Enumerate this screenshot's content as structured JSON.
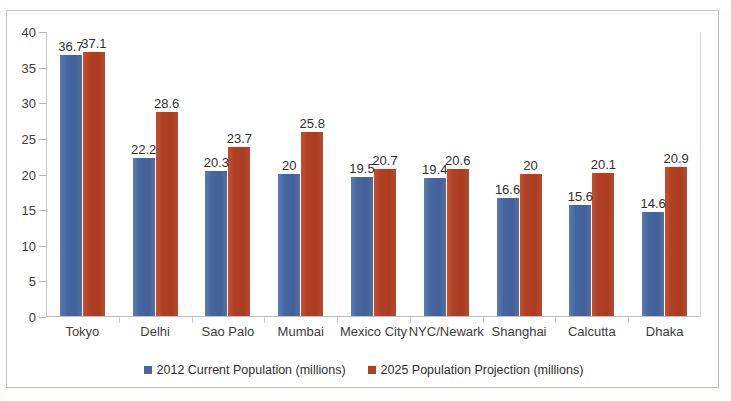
{
  "chart_data": {
    "type": "bar",
    "title": "",
    "xlabel": "",
    "ylabel": "",
    "ylim": [
      0,
      40
    ],
    "yticks": [
      0,
      5,
      10,
      15,
      20,
      25,
      30,
      35,
      40
    ],
    "grid": false,
    "legend_position": "bottom",
    "categories": [
      "Tokyo",
      "Delhi",
      "Sao Palo",
      "Mumbai",
      "Mexico City",
      "NYC/Newark",
      "Shanghai",
      "Calcutta",
      "Dhaka"
    ],
    "series": [
      {
        "name": "2012 Current Population (millions)",
        "color": "#46669f",
        "values": [
          36.7,
          22.2,
          20.3,
          20,
          19.5,
          19.4,
          16.6,
          15.6,
          14.6
        ],
        "labels": [
          "36.7",
          "22.2",
          "20.3",
          "20",
          "19.5",
          "19.4",
          "16.6",
          "15.6",
          "14.6"
        ]
      },
      {
        "name": "2025 Population Projection (millions)",
        "color": "#b03f24",
        "values": [
          37.1,
          28.6,
          23.7,
          25.8,
          20.7,
          20.6,
          20,
          20.1,
          20.9
        ],
        "labels": [
          "37.1",
          "28.6",
          "23.7",
          "25.8",
          "20.7",
          "20.6",
          "20",
          "20.1",
          "20.9"
        ]
      }
    ]
  },
  "colors": {
    "series_blue": "#46669f",
    "series_red": "#b03f24",
    "frame": "#b9b9b9",
    "axis": "#bdbdbd",
    "text": "#2f2f2f"
  },
  "title_remnant": ""
}
